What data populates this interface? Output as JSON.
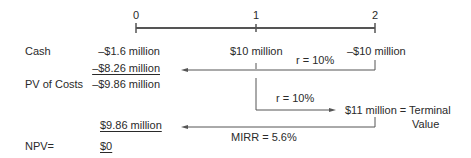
{
  "timeline": {
    "periods": [
      "0",
      "1",
      "2"
    ]
  },
  "rows": {
    "cash": {
      "label": "Cash",
      "values": [
        "–$1.6 million",
        "$10 million",
        "–$10 million"
      ]
    },
    "discounted_cost": "–$8.26 million",
    "pv_costs": {
      "label": "PV of Costs",
      "value": "–$9.86 million"
    },
    "pv_terminal": "$9.86 million",
    "npv": {
      "label": "NPV=",
      "value": "$0"
    }
  },
  "annotations": {
    "discount_rate_top": "r = 10%",
    "compound_rate": "r = 10%",
    "terminal_value_line1": "$11 million = Terminal",
    "terminal_value_line2": "Value",
    "mirr": "MIRR = 5.6%"
  },
  "colors": {
    "line": "#555555",
    "text": "#2a2a2a"
  }
}
